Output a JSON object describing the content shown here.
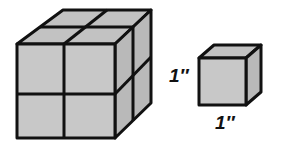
{
  "diagram": {
    "colors": {
      "face_front": "#c8c8c8",
      "face_top": "#c2c2c2",
      "face_side": "#b9b9b9",
      "edge": "#111111",
      "background": "#ffffff"
    },
    "large_cube": {
      "units_per_edge": 2,
      "unit_cubes": 8
    },
    "small_cube": {
      "units_per_edge": 1,
      "height_label": "1″",
      "width_label": "1″"
    }
  }
}
